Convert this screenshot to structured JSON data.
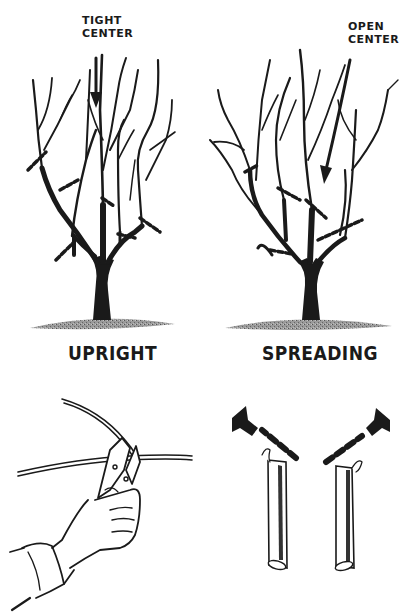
{
  "figure": {
    "upright_tree": {
      "caption": "UPRIGHT",
      "annotation_line1": "TIGHT",
      "annotation_line2": "CENTER"
    },
    "spreading_tree": {
      "caption": "SPREADING",
      "annotation_line1": "OPEN",
      "annotation_line2": "CENTER"
    },
    "pruning_shears_illustration": {
      "description": "hand holding pruning shears cutting a branch"
    },
    "bud_direction_illustration": {
      "description": "two branch stubs with dashed cut lines and arrows indicating bud growth direction"
    }
  },
  "colors": {
    "ink": "#1a1a1a",
    "ground": "#8a8a8a",
    "background": "#ffffff"
  }
}
